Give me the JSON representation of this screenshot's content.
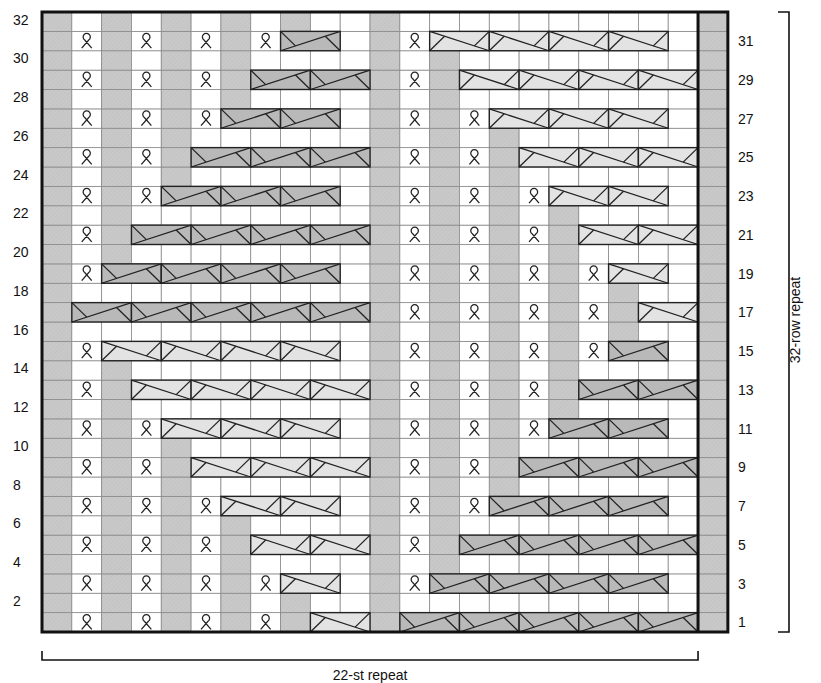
{
  "chart_data": {
    "type": "knitting-chart",
    "title": "",
    "stitch_repeat_label": "22-st repeat",
    "row_repeat_label": "32-row repeat",
    "columns": 22,
    "edge_columns": 1,
    "rows": 32,
    "left_row_labels": [
      "32",
      "30",
      "28",
      "26",
      "24",
      "22",
      "20",
      "18",
      "16",
      "14",
      "12",
      "10",
      "8",
      "6",
      "4",
      "2"
    ],
    "right_row_labels": [
      "31",
      "29",
      "27",
      "25",
      "23",
      "21",
      "19",
      "17",
      "15",
      "13",
      "11",
      "9",
      "7",
      "5",
      "3",
      "1"
    ],
    "colors": {
      "purl_gray": "#c9c9c9",
      "cable_dark": "#b9b9b9",
      "cable_light": "#e3e3e3",
      "grid_line": "#777777",
      "border": "#111111",
      "background": "#ffffff"
    },
    "legend_symbols": {
      "gray": "purl / shaded stitch",
      "loop": "twisted loop stitch",
      "cable_dark": "2-st right cross cable",
      "cable_light": "2-st left cross cable",
      "white": "knit stitch"
    },
    "always_gray_columns": [
      1,
      12,
      23
    ],
    "gray_columns": [
      {
        "col": 3,
        "rows_max": 14,
        "rows_min_top": 20
      },
      {
        "col": 5,
        "rows_max": 10,
        "rows_min_top": 24
      },
      {
        "col": 7,
        "rows_max": 6,
        "rows_min_top": 28
      },
      {
        "col": 9,
        "rows_max": 2,
        "rows_min_top": 32
      },
      {
        "col": 14,
        "from": 4,
        "to": 30
      },
      {
        "col": 16,
        "from": 8,
        "to": 26
      },
      {
        "col": 18,
        "from": 12,
        "to": 22
      },
      {
        "col": 20,
        "from": 16,
        "to": 18
      }
    ],
    "left_loop_columns": [
      2,
      4,
      6,
      8
    ],
    "right_loop_columns": [
      13,
      15,
      17,
      19
    ],
    "cables": [
      {
        "row": 1,
        "start": 10,
        "end": 11,
        "shade": "light"
      },
      {
        "row": 1,
        "start": 13,
        "end": 22,
        "shade": "dark"
      },
      {
        "row": 3,
        "start": 9,
        "end": 10,
        "shade": "light"
      },
      {
        "row": 3,
        "start": 14,
        "end": 21,
        "shade": "dark"
      },
      {
        "row": 5,
        "start": 8,
        "end": 11,
        "shade": "light"
      },
      {
        "row": 5,
        "start": 15,
        "end": 22,
        "shade": "dark"
      },
      {
        "row": 7,
        "start": 7,
        "end": 10,
        "shade": "light"
      },
      {
        "row": 7,
        "start": 16,
        "end": 21,
        "shade": "dark"
      },
      {
        "row": 9,
        "start": 6,
        "end": 11,
        "shade": "light"
      },
      {
        "row": 9,
        "start": 17,
        "end": 22,
        "shade": "dark"
      },
      {
        "row": 11,
        "start": 5,
        "end": 10,
        "shade": "light"
      },
      {
        "row": 11,
        "start": 18,
        "end": 21,
        "shade": "dark"
      },
      {
        "row": 13,
        "start": 4,
        "end": 11,
        "shade": "light"
      },
      {
        "row": 13,
        "start": 19,
        "end": 22,
        "shade": "dark"
      },
      {
        "row": 15,
        "start": 3,
        "end": 10,
        "shade": "light"
      },
      {
        "row": 15,
        "start": 20,
        "end": 21,
        "shade": "dark"
      },
      {
        "row": 17,
        "start": 2,
        "end": 11,
        "shade": "dark"
      },
      {
        "row": 17,
        "start": 21,
        "end": 22,
        "shade": "light"
      },
      {
        "row": 19,
        "start": 3,
        "end": 10,
        "shade": "dark"
      },
      {
        "row": 19,
        "start": 20,
        "end": 21,
        "shade": "light"
      },
      {
        "row": 21,
        "start": 4,
        "end": 11,
        "shade": "dark"
      },
      {
        "row": 21,
        "start": 19,
        "end": 22,
        "shade": "light"
      },
      {
        "row": 23,
        "start": 5,
        "end": 10,
        "shade": "dark"
      },
      {
        "row": 23,
        "start": 18,
        "end": 21,
        "shade": "light"
      },
      {
        "row": 25,
        "start": 6,
        "end": 11,
        "shade": "dark"
      },
      {
        "row": 25,
        "start": 17,
        "end": 22,
        "shade": "light"
      },
      {
        "row": 27,
        "start": 7,
        "end": 10,
        "shade": "dark"
      },
      {
        "row": 27,
        "start": 16,
        "end": 21,
        "shade": "light"
      },
      {
        "row": 29,
        "start": 8,
        "end": 11,
        "shade": "dark"
      },
      {
        "row": 29,
        "start": 15,
        "end": 22,
        "shade": "light"
      },
      {
        "row": 31,
        "start": 9,
        "end": 10,
        "shade": "dark"
      },
      {
        "row": 31,
        "start": 14,
        "end": 21,
        "shade": "light"
      }
    ]
  },
  "labels": {
    "stitch_repeat": "22-st repeat",
    "row_repeat": "32-row repeat"
  }
}
